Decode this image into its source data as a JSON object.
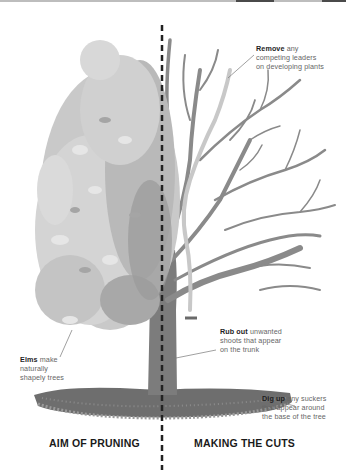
{
  "header": {
    "strip_color": "#bdbdbd"
  },
  "annotations": {
    "remove": {
      "bold": "Remove",
      "rest_line1": " any",
      "line2": "competing leaders",
      "line3": "on developing plants"
    },
    "rub_out": {
      "bold": "Rub out",
      "rest_line1": " unwanted",
      "line2": "shoots that appear",
      "line3": "on the trunk"
    },
    "dig_up": {
      "bold": "Dig up",
      "rest_line1": " any suckers",
      "line2": "that appear around",
      "line3": "the base of the tree"
    },
    "elms": {
      "bold": "Elms",
      "rest_line1": " make",
      "line2": "naturally",
      "line3": "shapely trees"
    }
  },
  "captions": {
    "left": "AIM OF PRUNING",
    "right": "MAKING THE CUTS"
  },
  "colors": {
    "foliage_light": "#d4d4d4",
    "foliage_mid": "#b9b9b9",
    "foliage_dark": "#9a9a9a",
    "branch": "#8a8a8a",
    "competing_leader": "#c8c8c8",
    "trunk": "#7c7c7c",
    "soil": "#6e6e6e",
    "divider": "#222222"
  }
}
